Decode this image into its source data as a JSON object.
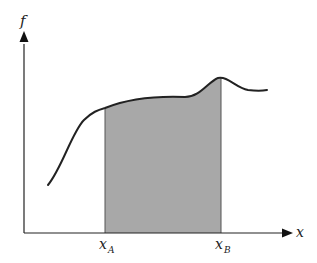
{
  "diagram": {
    "axes": {
      "y_label": "f",
      "x_label": "x"
    },
    "bounds": {
      "a": {
        "base": "x",
        "subscript": "A"
      },
      "b": {
        "base": "x",
        "subscript": "B"
      }
    },
    "colors": {
      "fill": "#a8a8a8",
      "curve": "#222222",
      "axis": "#222222"
    }
  }
}
